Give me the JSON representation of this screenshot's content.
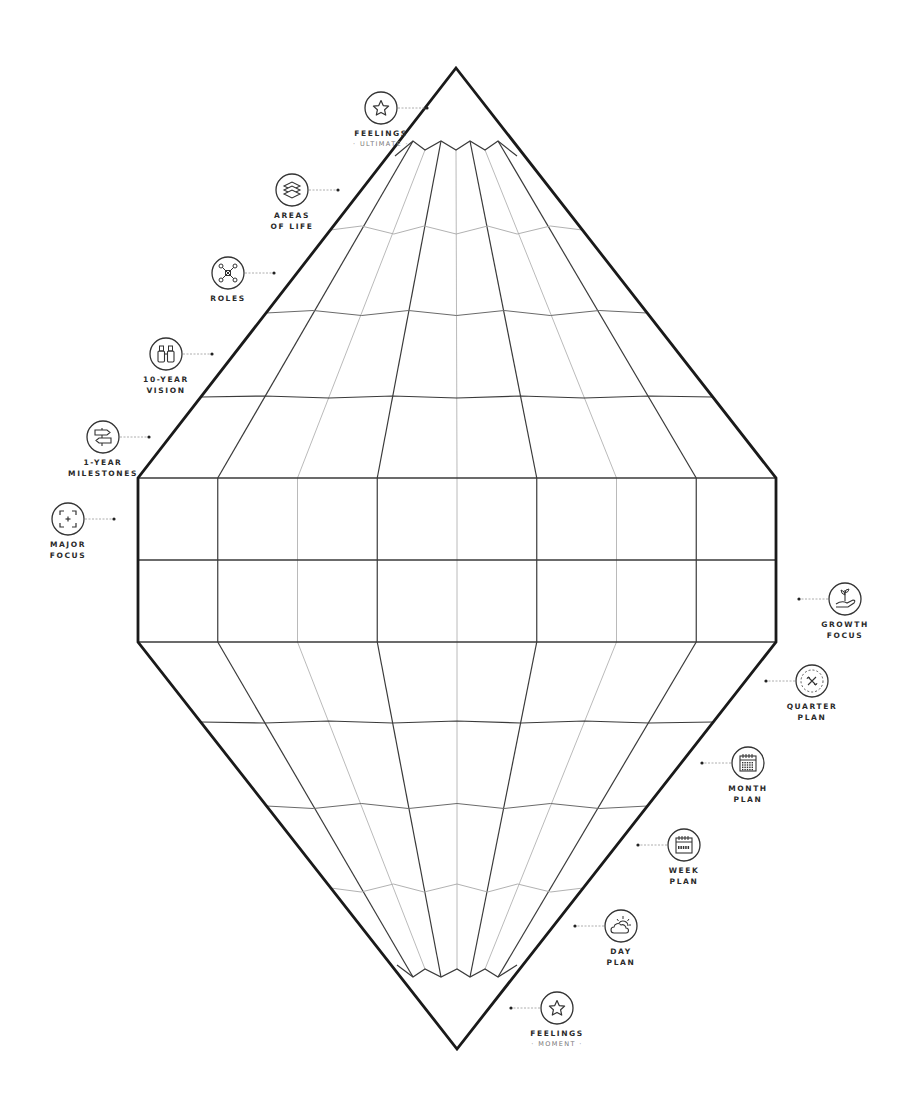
{
  "diagram": {
    "title": "",
    "colors": {
      "outline": "#1a1a1a",
      "grid_dark": "#3a3a3a",
      "grid_mid": "#6a6a6a",
      "grid_light": "#a8a8a8",
      "icon_stroke": "#333333",
      "text": "#2a2a2a",
      "subtext": "#777777",
      "background": "#ffffff"
    },
    "shape": {
      "top_tip": [
        456,
        68
      ],
      "bottom_tip": [
        457,
        1049
      ],
      "left_x": 138,
      "right_x": 776,
      "band_top_y": 478,
      "band_mid_y": 560,
      "band_bottom_y": 642
    },
    "nodes": [
      {
        "id": "feelings-ultimate",
        "icon": "star-icon",
        "title": "FEELINGS",
        "subtitle": "· ULTIMATE ·",
        "side": "left",
        "cx": 381,
        "cy": 108
      },
      {
        "id": "areas-of-life",
        "icon": "layers-icon",
        "title": "AREAS",
        "title2": "OF LIFE",
        "side": "left",
        "cx": 292,
        "cy": 190
      },
      {
        "id": "roles",
        "icon": "network-icon",
        "title": "ROLES",
        "side": "left",
        "cx": 228,
        "cy": 273
      },
      {
        "id": "10-year-vision",
        "icon": "binoculars-icon",
        "title": "10-YEAR",
        "title2": "VISION",
        "side": "left",
        "cx": 166,
        "cy": 354
      },
      {
        "id": "1-year-milestones",
        "icon": "signpost-icon",
        "title": "1-YEAR",
        "title2": "MILESTONES",
        "side": "left",
        "cx": 103,
        "cy": 437
      },
      {
        "id": "major-focus",
        "icon": "focus-target-icon",
        "title": "MAJOR",
        "title2": "FOCUS",
        "side": "left",
        "cx": 68,
        "cy": 519
      },
      {
        "id": "growth-focus",
        "icon": "plant-in-hand-icon",
        "title": "GROWTH",
        "title2": "FOCUS",
        "side": "right",
        "cx": 845,
        "cy": 599
      },
      {
        "id": "quarter-plan",
        "icon": "quarter-cycle-icon",
        "title": "QUARTER",
        "title2": "PLAN",
        "side": "right",
        "cx": 812,
        "cy": 681
      },
      {
        "id": "month-plan",
        "icon": "month-calendar-icon",
        "title": "MONTH",
        "title2": "PLAN",
        "side": "right",
        "cx": 748,
        "cy": 763
      },
      {
        "id": "week-plan",
        "icon": "week-calendar-icon",
        "title": "WEEK",
        "title2": "PLAN",
        "side": "right",
        "cx": 684,
        "cy": 845
      },
      {
        "id": "day-plan",
        "icon": "sun-cloud-icon",
        "title": "DAY",
        "title2": "PLAN",
        "side": "right",
        "cx": 621,
        "cy": 926
      },
      {
        "id": "feelings-moment",
        "icon": "star-icon",
        "title": "FEELINGS",
        "subtitle": "· MOMENT ·",
        "side": "right",
        "cx": 557,
        "cy": 1008
      }
    ]
  }
}
